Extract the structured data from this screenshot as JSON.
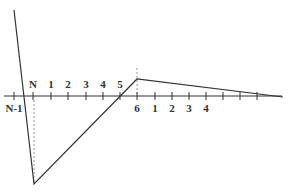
{
  "diagram": {
    "colors": {
      "line": "#333333",
      "dashed": "#777777",
      "background": "#ffffff"
    },
    "axis": {
      "y": 96,
      "x_start": 4,
      "x_end": 282
    },
    "upper_labels": [
      {
        "text": "N",
        "x": 33
      },
      {
        "text": "1",
        "x": 51
      },
      {
        "text": "2",
        "x": 68
      },
      {
        "text": "3",
        "x": 86
      },
      {
        "text": "4",
        "x": 103
      },
      {
        "text": "5",
        "x": 120
      }
    ],
    "lower_labels": [
      {
        "text": "N-1",
        "x": 14
      },
      {
        "text": "6",
        "x": 137
      },
      {
        "text": "1",
        "x": 155
      },
      {
        "text": "2",
        "x": 172
      },
      {
        "text": "3",
        "x": 189
      },
      {
        "text": "4",
        "x": 206
      }
    ],
    "ticks_x": [
      14,
      33,
      51,
      68,
      86,
      103,
      120,
      137,
      155,
      172,
      189,
      206,
      223,
      240,
      257
    ],
    "polyline": [
      [
        14,
        10
      ],
      [
        34,
        184
      ],
      [
        137,
        79
      ],
      [
        283,
        97
      ]
    ],
    "dashed_lines": [
      {
        "x": 34,
        "y1": 96,
        "y2": 184
      },
      {
        "x": 137,
        "y1": 68,
        "y2": 96
      }
    ]
  }
}
